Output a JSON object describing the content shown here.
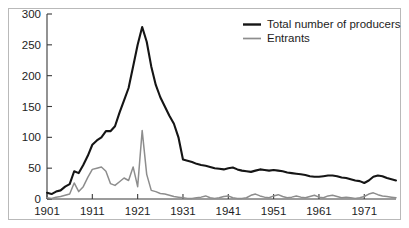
{
  "chart_data": {
    "type": "line",
    "title": "",
    "subtitle": "",
    "xlabel": "",
    "ylabel": "",
    "xlim": [
      1901,
      1978
    ],
    "ylim": [
      0,
      300
    ],
    "grid": false,
    "legend_position": "top-right",
    "x_tick_labels": [
      "1901",
      "1911",
      "1921",
      "1931",
      "1941",
      "1951",
      "1961",
      "1971"
    ],
    "x_ticks": [
      1901,
      1911,
      1921,
      1931,
      1941,
      1951,
      1961,
      1971
    ],
    "y_tick_labels": [
      "0",
      "50",
      "100",
      "150",
      "200",
      "250",
      "300"
    ],
    "y_ticks": [
      0,
      50,
      100,
      150,
      200,
      250,
      300
    ],
    "x": [
      1901,
      1902,
      1903,
      1904,
      1905,
      1906,
      1907,
      1908,
      1909,
      1910,
      1911,
      1912,
      1913,
      1914,
      1915,
      1916,
      1917,
      1918,
      1919,
      1920,
      1921,
      1922,
      1923,
      1924,
      1925,
      1926,
      1927,
      1928,
      1929,
      1930,
      1931,
      1932,
      1933,
      1934,
      1935,
      1936,
      1937,
      1938,
      1939,
      1940,
      1941,
      1942,
      1943,
      1944,
      1945,
      1946,
      1947,
      1948,
      1949,
      1950,
      1951,
      1952,
      1953,
      1954,
      1955,
      1956,
      1957,
      1958,
      1959,
      1960,
      1961,
      1962,
      1963,
      1964,
      1965,
      1966,
      1967,
      1968,
      1969,
      1970,
      1971,
      1972,
      1973,
      1974,
      1975,
      1976,
      1977,
      1978
    ],
    "series": [
      {
        "name": "Total number of producers",
        "color": "#151515",
        "values": [
          10,
          8,
          12,
          14,
          20,
          24,
          45,
          42,
          55,
          70,
          88,
          95,
          100,
          110,
          110,
          118,
          140,
          160,
          180,
          215,
          250,
          279,
          255,
          215,
          185,
          165,
          150,
          135,
          122,
          100,
          64,
          62,
          60,
          57,
          55,
          54,
          52,
          50,
          49,
          48,
          50,
          51,
          48,
          46,
          45,
          44,
          46,
          48,
          47,
          46,
          47,
          46,
          45,
          43,
          42,
          41,
          40,
          39,
          37,
          36,
          36,
          37,
          38,
          38,
          37,
          35,
          34,
          32,
          30,
          29,
          26,
          30,
          36,
          38,
          37,
          34,
          32,
          30
        ]
      },
      {
        "name": "Entrants",
        "color": "#8d8d8d",
        "values": [
          2,
          1,
          3,
          4,
          6,
          8,
          26,
          12,
          20,
          35,
          48,
          50,
          52,
          45,
          25,
          22,
          28,
          34,
          30,
          52,
          20,
          111,
          40,
          14,
          12,
          9,
          8,
          6,
          4,
          3,
          2,
          1,
          1,
          2,
          3,
          5,
          2,
          1,
          2,
          4,
          5,
          2,
          1,
          1,
          2,
          6,
          8,
          5,
          3,
          2,
          5,
          7,
          4,
          2,
          3,
          5,
          3,
          2,
          4,
          6,
          3,
          2,
          5,
          6,
          4,
          2,
          3,
          2,
          1,
          2,
          4,
          8,
          10,
          7,
          5,
          4,
          3,
          2
        ]
      }
    ],
    "legend": [
      {
        "label": "Total number of producers",
        "color": "#151515",
        "style": "thick-solid"
      },
      {
        "label": "Entrants",
        "color": "#8d8d8d",
        "style": "thin-solid"
      }
    ]
  },
  "colors": {
    "producers": "#151515",
    "entrants": "#8d8d8d",
    "axis": "#3a3a3a",
    "frame": "#b9b9b9",
    "background": "#ffffff",
    "text": "#1d1d1d"
  }
}
